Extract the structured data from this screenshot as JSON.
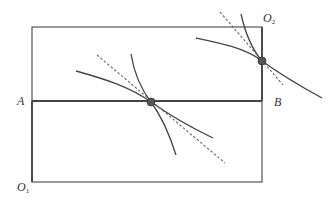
{
  "diagram": {
    "type": "edgeworth-box",
    "colors": {
      "line": "#444444",
      "dash": "#666666",
      "point": "#555555",
      "background": "#ffffff"
    },
    "labels": {
      "origin1": {
        "main": "O",
        "sub": "1"
      },
      "origin2": {
        "main": "O",
        "sub": "2"
      },
      "pointA": "A",
      "pointB": "B"
    },
    "box": {
      "x1": 32,
      "y1": 27,
      "x2": 262,
      "y2": 182
    },
    "line_ab": {
      "y": 101
    },
    "tangency_points": [
      {
        "name": "center",
        "x": 151,
        "y": 102
      },
      {
        "name": "upper-right",
        "x": 262,
        "y": 61
      }
    ]
  }
}
